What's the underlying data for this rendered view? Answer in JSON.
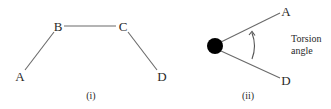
{
  "panels": [
    {
      "caption": "(i)",
      "atoms": [
        {
          "label": "A",
          "x": 20,
          "y": 76
        },
        {
          "label": "B",
          "x": 58,
          "y": 26
        },
        {
          "label": "C",
          "x": 123,
          "y": 26
        },
        {
          "label": "D",
          "x": 161,
          "y": 76
        }
      ]
    },
    {
      "caption": "(ii)",
      "atoms": [
        {
          "label": "A"
        },
        {
          "label": "D"
        }
      ],
      "annotation_line1": "Torsion",
      "annotation_line2": "angle"
    }
  ],
  "colors": {
    "line": "#6a6a6a",
    "text": "#2a2a2a",
    "dot": "#000000"
  }
}
